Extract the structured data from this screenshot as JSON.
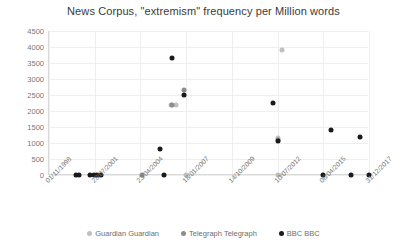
{
  "chart_data": {
    "type": "scatter",
    "title": "News Corpus, \"extremism\" frequency per Million words",
    "xlabel": "",
    "ylabel": "",
    "ylim": [
      0,
      4500
    ],
    "ytick_labels": [
      "0",
      "500",
      "1000",
      "1500",
      "2000",
      "2500",
      "3000",
      "3500",
      "4000",
      "4500"
    ],
    "ytick_values": [
      0,
      500,
      1000,
      1500,
      2000,
      2500,
      3000,
      3500,
      4000,
      4500
    ],
    "xtick_labels": [
      "01/11/1998",
      "28/07/2001",
      "23/04/2004",
      "18/01/2007",
      "14/10/2009",
      "10/07/2012",
      "06/04/2015",
      "31/12/2017"
    ],
    "xlim": [
      "01/11/1998",
      "31/12/2017"
    ],
    "grid": true,
    "legend_position": "bottom",
    "series": [
      {
        "name": "Guardian Guardian",
        "color": "#bfbfbf",
        "points": [
          {
            "x": "20/02/2006",
            "y": 2200
          },
          {
            "x": "02/06/2006",
            "y": 2200
          },
          {
            "x": "18/01/2007",
            "y": 0
          },
          {
            "x": "21/10/2012",
            "y": 3900
          },
          {
            "x": "25/07/2012",
            "y": 1150
          },
          {
            "x": "10/07/2012",
            "y": 0
          }
        ]
      },
      {
        "name": "Telegraph Telegraph",
        "color": "#8c8c8c",
        "points": [
          {
            "x": "05/03/2006",
            "y": 2200
          },
          {
            "x": "10/12/2006",
            "y": 2650
          },
          {
            "x": "03/06/2004",
            "y": 0
          },
          {
            "x": "25/07/2012",
            "y": 1100
          }
        ]
      },
      {
        "name": "BBC BBC",
        "color": "#1a1a1a",
        "points": [
          {
            "x": "10/06/2000",
            "y": 0
          },
          {
            "x": "28/08/2000",
            "y": 0
          },
          {
            "x": "14/04/2001",
            "y": 0
          },
          {
            "x": "02/07/2001",
            "y": 0
          },
          {
            "x": "20/09/2001",
            "y": 0
          },
          {
            "x": "08/12/2001",
            "y": 0
          },
          {
            "x": "15/06/2005",
            "y": 800
          },
          {
            "x": "20/09/2005",
            "y": 0
          },
          {
            "x": "05/03/2006",
            "y": 3650
          },
          {
            "x": "10/12/2006",
            "y": 2500
          },
          {
            "x": "22/03/2012",
            "y": 2250
          },
          {
            "x": "28/07/2012",
            "y": 1050
          },
          {
            "x": "12/09/2015",
            "y": 1400
          },
          {
            "x": "20/06/2017",
            "y": 1200
          },
          {
            "x": "06/04/2015",
            "y": 0
          },
          {
            "x": "10/12/2016",
            "y": 0
          },
          {
            "x": "31/12/2017",
            "y": 0
          }
        ]
      }
    ]
  },
  "legend": {
    "items": [
      {
        "label": "Guardian Guardian",
        "color": "#bfbfbf"
      },
      {
        "label": "Telegraph Telegraph",
        "color": "#8c8c8c"
      },
      {
        "label": "BBC BBC",
        "color": "#1a1a1a"
      }
    ]
  }
}
